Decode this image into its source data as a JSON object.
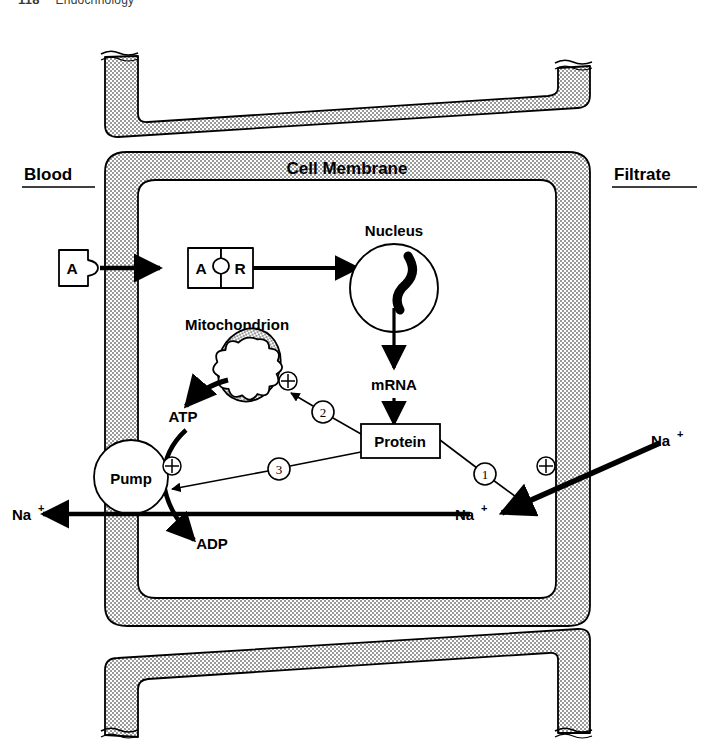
{
  "header": {
    "page_number": "118",
    "separator": "•",
    "section": "Endocrinology"
  },
  "figure": {
    "compartments": {
      "blood_label": "Blood",
      "filtrate_label": "Filtrate",
      "membrane_label": "Cell Membrane"
    },
    "organelles": {
      "nucleus_label": "Nucleus",
      "mitochondrion_label": "Mitochondrion"
    },
    "molecules": {
      "aldosterone": "A",
      "receptor": "R",
      "mrna": "mRNA",
      "protein": "Protein",
      "atp": "ATP",
      "adp": "ADP",
      "pump": "Pump",
      "sodium_filtrate": "Na",
      "sodium_cytosol": "Na",
      "sodium_blood": "Na",
      "sodium_charge": "+"
    },
    "steps": [
      {
        "id": "1",
        "glyph": "①",
        "effect": "+",
        "target": "sodium-channel-permeability"
      },
      {
        "id": "2",
        "glyph": "②",
        "effect": "+",
        "target": "mitochondrial-atp-production"
      },
      {
        "id": "3",
        "glyph": "③",
        "effect": "+",
        "target": "sodium-potassium-pump"
      }
    ],
    "plus_signs": [
      "+",
      "+",
      "+"
    ],
    "colors": {
      "ink": "#000000",
      "membrane_fill": "#d8d8d8",
      "cell_interior": "#ffffff",
      "page_background": "#ffffff",
      "header_text": "#3a3a3a"
    }
  }
}
